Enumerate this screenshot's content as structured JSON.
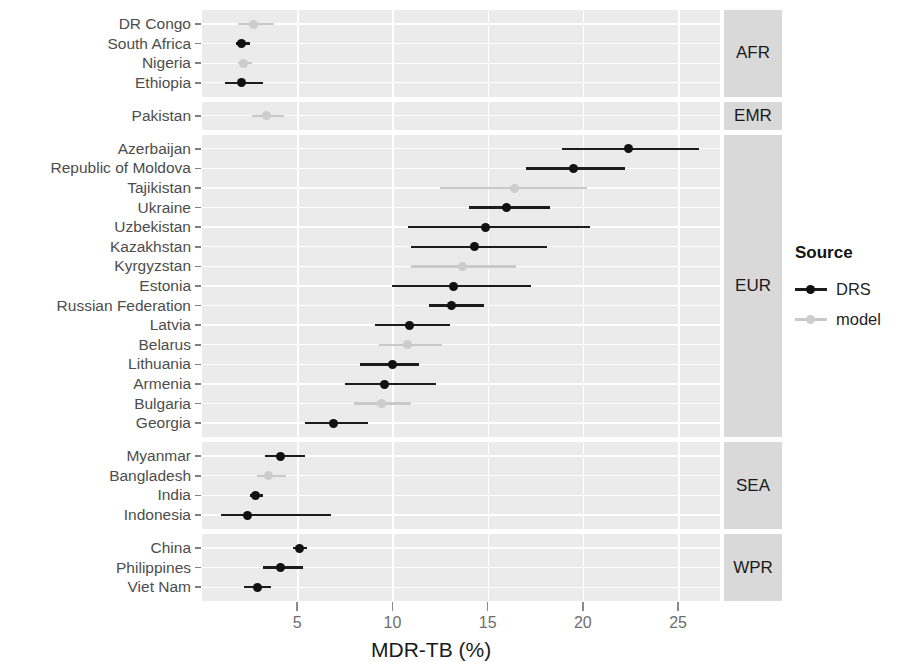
{
  "chart_data": {
    "type": "scatter",
    "subtype": "dot-and-whisker forest plot",
    "title": "",
    "xlabel": "MDR-TB (%)",
    "ylabel": "",
    "xlim": [
      0,
      27.2
    ],
    "xticks": [
      5,
      10,
      15,
      20,
      25
    ],
    "xticklabels": [
      "5",
      "10",
      "15",
      "20",
      "25"
    ],
    "grid": true,
    "legend": {
      "title": "Source",
      "position": "right",
      "entries": [
        {
          "label": "DRS",
          "color": "#111111"
        },
        {
          "label": "model",
          "color": "#cdcdcd"
        }
      ]
    },
    "facets": [
      {
        "strip_label": "AFR",
        "rows": [
          {
            "country": "DR Congo",
            "source": "model",
            "value": 2.7,
            "low": 1.9,
            "high": 3.8
          },
          {
            "country": "South Africa",
            "source": "DRS",
            "value": 2.1,
            "low": 1.8,
            "high": 2.5
          },
          {
            "country": "Nigeria",
            "source": "model",
            "value": 2.2,
            "low": 1.9,
            "high": 2.6
          },
          {
            "country": "Ethiopia",
            "source": "DRS",
            "value": 2.1,
            "low": 1.2,
            "high": 3.2
          }
        ]
      },
      {
        "strip_label": "EMR",
        "rows": [
          {
            "country": "Pakistan",
            "source": "model",
            "value": 3.4,
            "low": 2.6,
            "high": 4.3
          }
        ]
      },
      {
        "strip_label": "EUR",
        "rows": [
          {
            "country": "Azerbaijan",
            "source": "DRS",
            "value": 22.4,
            "low": 18.9,
            "high": 26.1
          },
          {
            "country": "Republic of Moldova",
            "source": "DRS",
            "value": 19.5,
            "low": 17.0,
            "high": 22.2
          },
          {
            "country": "Tajikistan",
            "source": "model",
            "value": 16.4,
            "low": 12.5,
            "high": 20.2
          },
          {
            "country": "Ukraine",
            "source": "DRS",
            "value": 16.0,
            "low": 14.0,
            "high": 18.3
          },
          {
            "country": "Uzbekistan",
            "source": "DRS",
            "value": 14.9,
            "low": 10.8,
            "high": 20.4
          },
          {
            "country": "Kazakhstan",
            "source": "DRS",
            "value": 14.3,
            "low": 11.0,
            "high": 18.1
          },
          {
            "country": "Kyrgyzstan",
            "source": "model",
            "value": 13.7,
            "low": 11.0,
            "high": 16.5
          },
          {
            "country": "Estonia",
            "source": "DRS",
            "value": 13.2,
            "low": 10.0,
            "high": 17.3
          },
          {
            "country": "Russian Federation",
            "source": "DRS",
            "value": 13.1,
            "low": 11.9,
            "high": 14.8
          },
          {
            "country": "Latvia",
            "source": "DRS",
            "value": 10.9,
            "low": 9.1,
            "high": 13.0
          },
          {
            "country": "Belarus",
            "source": "model",
            "value": 10.8,
            "low": 9.3,
            "high": 12.6
          },
          {
            "country": "Lithuania",
            "source": "DRS",
            "value": 10.0,
            "low": 8.3,
            "high": 11.4
          },
          {
            "country": "Armenia",
            "source": "DRS",
            "value": 9.6,
            "low": 7.5,
            "high": 12.3
          },
          {
            "country": "Bulgaria",
            "source": "model",
            "value": 9.4,
            "low": 8.0,
            "high": 11.0
          },
          {
            "country": "Georgia",
            "source": "DRS",
            "value": 6.9,
            "low": 5.4,
            "high": 8.7
          }
        ]
      },
      {
        "strip_label": "SEA",
        "rows": [
          {
            "country": "Myanmar",
            "source": "DRS",
            "value": 4.1,
            "low": 3.3,
            "high": 5.4
          },
          {
            "country": "Bangladesh",
            "source": "model",
            "value": 3.5,
            "low": 2.9,
            "high": 4.4
          },
          {
            "country": "India",
            "source": "DRS",
            "value": 2.8,
            "low": 2.5,
            "high": 3.2
          },
          {
            "country": "Indonesia",
            "source": "DRS",
            "value": 2.4,
            "low": 1.0,
            "high": 6.8
          }
        ]
      },
      {
        "strip_label": "WPR",
        "rows": [
          {
            "country": "China",
            "source": "DRS",
            "value": 5.1,
            "low": 4.8,
            "high": 5.5
          },
          {
            "country": "Philippines",
            "source": "DRS",
            "value": 4.1,
            "low": 3.2,
            "high": 5.3
          },
          {
            "country": "Viet Nam",
            "source": "DRS",
            "value": 2.9,
            "low": 2.2,
            "high": 3.6
          }
        ]
      }
    ]
  },
  "colors": {
    "panel_background": "#ebebeb",
    "strip_background": "#d9d9d9",
    "gridline": "#ffffff",
    "drs": "#111111",
    "model": "#cdcdcd",
    "axis_text": "#4d4d4d"
  }
}
